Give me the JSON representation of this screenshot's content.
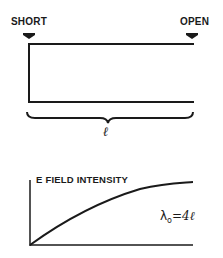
{
  "top_diagram": {
    "left_label": "SHORT",
    "right_label": "OPEN",
    "length_symbol": "ℓ"
  },
  "bottom_graph": {
    "y_axis_label": "E FIELD INTENSITY",
    "annotation_lambda": "λ",
    "annotation_sub": "o",
    "annotation_rest": "=4ℓ"
  },
  "colors": {
    "ink": "#1a1a1a",
    "background": "#ffffff"
  }
}
